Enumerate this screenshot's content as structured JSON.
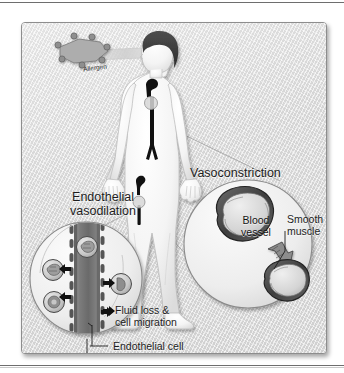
{
  "figure": {
    "title_present": false,
    "background_color": "#e6e6e6",
    "panel_border_color": "#8d8d8d",
    "ink_color": "#1d1d1d"
  },
  "labels": {
    "allergen": "Allergen",
    "vasoconstriction": "Vasoconstriction",
    "endothelial_vasodilation": "Endothelial\nvasodilation",
    "blood_vessel_inset": "Blood\nvessel",
    "smooth_muscle": "Smooth\nmuscle",
    "fluid_loss_cell_migration": "Fluid loss &\ncell migration",
    "endothelial_cell": "Endothelial cell",
    "blood_vessel_callout": "Blood vessel"
  },
  "diagram": {
    "insets": [
      {
        "name": "endothelial-vasodilation-inset",
        "position": "lower-left",
        "contents": [
          "blood-vessel",
          "endothelial-cells",
          "migrating-cells",
          "outward-arrows"
        ],
        "arrow_count": 5
      },
      {
        "name": "vasoconstriction-inset",
        "position": "right",
        "contents": [
          "dilated-vessel-cross-section",
          "transition-arrow",
          "constricted-vessel-cross-section",
          "smooth-muscle-layer"
        ]
      }
    ],
    "markers": [
      {
        "name": "torso-vessel-marker",
        "location": "chest"
      },
      {
        "name": "leg-vessel-marker",
        "location": "left-leg"
      }
    ],
    "allergen_molecule": {
      "node_count": 7,
      "arrow_direction": "toward-face"
    }
  }
}
